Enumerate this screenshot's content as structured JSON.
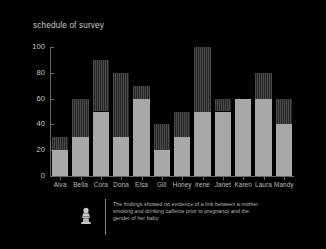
{
  "chart_data": {
    "type": "bar",
    "title": "schedule of survey",
    "xlabel": "",
    "ylabel": "",
    "ylim": [
      0,
      100
    ],
    "yticks": [
      0,
      20,
      40,
      60,
      80,
      100
    ],
    "grid": false,
    "legend": "none",
    "stacked": true,
    "categories": [
      "Alva",
      "Bella",
      "Cora",
      "Dona",
      "Elsa",
      "Gill",
      "Honey",
      "Irene",
      "Janet",
      "Karen",
      "Laura",
      "Mandy"
    ],
    "series": [
      {
        "name": "lower",
        "color": "#a8a8a8",
        "values": [
          20,
          30,
          50,
          30,
          60,
          20,
          30,
          50,
          50,
          60,
          60,
          40
        ]
      },
      {
        "name": "upper",
        "color": "#3a3a3a",
        "values": [
          10,
          30,
          40,
          50,
          10,
          20,
          20,
          50,
          10,
          0,
          20,
          20
        ]
      }
    ],
    "totals": [
      30,
      60,
      90,
      80,
      70,
      40,
      50,
      100,
      60,
      60,
      80,
      60
    ]
  },
  "caption": {
    "icon": "figure-icon",
    "text": "The findings showed no evidence of a link between a mother smoking and drinking caffeine prior to pregnancy and the gender of her baby"
  },
  "colors": {
    "background": "#000000",
    "axis": "#6a6a6a",
    "text": "#c6c6c6",
    "bar_lower": "#a8a8a8",
    "bar_upper": "#3a3a3a"
  }
}
